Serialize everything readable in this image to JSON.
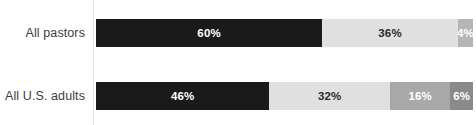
{
  "chart_data": {
    "type": "bar",
    "orientation": "horizontal",
    "stacked": true,
    "normalized_percent": true,
    "title": "",
    "subtitle": "",
    "xlabel": "",
    "ylabel": "",
    "xlim": [
      0,
      100
    ],
    "grid": false,
    "legend": "none",
    "categories": [
      "All pastors",
      "All U.S. adults"
    ],
    "series": [
      {
        "name": "Segment 1",
        "color": "#1a1a1a",
        "label_color": "#ffffff",
        "values": [
          60,
          46
        ]
      },
      {
        "name": "Segment 2",
        "color": "#e0e0e0",
        "label_color": "#2b2b2b",
        "values": [
          36,
          32
        ]
      },
      {
        "name": "Segment 3",
        "color": "#b5b5b5",
        "label_color": "#ffffff",
        "values": [
          4,
          16
        ]
      },
      {
        "name": "Segment 4",
        "color": "#8a8a8a",
        "label_color": "#ffffff",
        "values": [
          null,
          6
        ]
      }
    ],
    "rows": [
      {
        "category": "All pastors",
        "segments": [
          {
            "value": 60,
            "label": "60%",
            "color": "#1a1a1a",
            "label_color": "#ffffff"
          },
          {
            "value": 36,
            "label": "36%",
            "color": "#e0e0e0",
            "label_color": "#2b2b2b"
          },
          {
            "value": 4,
            "label": "4%",
            "color": "#b5b5b5",
            "label_color": "#ffffff"
          }
        ]
      },
      {
        "category": "All U.S. adults",
        "segments": [
          {
            "value": 46,
            "label": "46%",
            "color": "#1a1a1a",
            "label_color": "#ffffff"
          },
          {
            "value": 32,
            "label": "32%",
            "color": "#e0e0e0",
            "label_color": "#2b2b2b"
          },
          {
            "value": 16,
            "label": "16%",
            "color": "#a8a8a8",
            "label_color": "#ffffff"
          },
          {
            "value": 6,
            "label": "6%",
            "color": "#8a8a8a",
            "label_color": "#ffffff"
          }
        ]
      }
    ]
  },
  "axis": {
    "line_color": "#e3e3e3"
  },
  "styling": {
    "background": "#ffffff",
    "label_color": "#3d3d3d"
  }
}
